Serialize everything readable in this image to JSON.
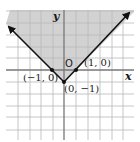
{
  "diagram": {
    "type": "graph-of-inequality",
    "axes": {
      "x_label": "x",
      "y_label": "y",
      "origin_label": "O"
    },
    "points": [
      {
        "label": "(−1, 0)",
        "x": -1,
        "y": 0
      },
      {
        "label": "(0, −1)",
        "x": 0,
        "y": -1
      },
      {
        "label": "(1, 0)",
        "x": 1,
        "y": 0
      }
    ],
    "shading": "above",
    "colors": {
      "shade": "#cfcfcf",
      "grid": "#b5b5b5",
      "line": "#111111",
      "axis": "#777777"
    }
  }
}
